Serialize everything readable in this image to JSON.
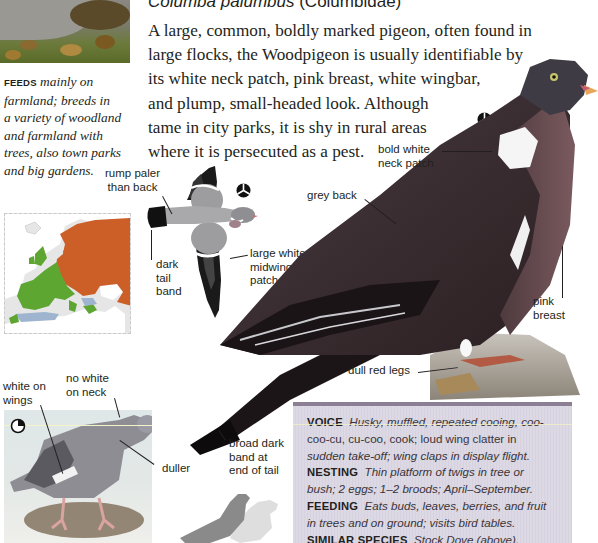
{
  "header": {
    "latin_name": "Columba palumbus",
    "family": "(Columbidae)"
  },
  "intro": {
    "lines": [
      "A large, common, boldly marked pigeon, often found in",
      "large flocks, the Woodpigeon is usually identifiable by",
      "its white neck patch, pink breast, white wingbar,",
      "and plump, small-headed look. Although",
      "tame in city parks, it is shy in rural areas",
      "where it is persecuted as a pest."
    ]
  },
  "feeds": {
    "keyword": "FEEDS",
    "lines": [
      "mainly on",
      "farmland; breeds in",
      "a variety of woodland",
      "and farmland with",
      "trees, also town parks",
      "and big gardens."
    ]
  },
  "flight_labels": {
    "rump": [
      "rump paler",
      "than back"
    ],
    "tail_band": [
      "dark",
      "tail",
      "band"
    ],
    "midwing": [
      "large white",
      "midwing",
      "patch"
    ]
  },
  "adult_labels": {
    "neck_patch": [
      "bold white",
      "neck patch"
    ],
    "grey_back": "grey back",
    "pink_breast": [
      "pink",
      "breast"
    ],
    "legs": "dull red legs",
    "tail_end": [
      "broad dark",
      "band at",
      "end of tail"
    ]
  },
  "juvenile_labels": {
    "white_wings": [
      "white on",
      "wings"
    ],
    "no_white_neck": [
      "no white",
      "on neck"
    ],
    "duller": "duller"
  },
  "symbols": {
    "adult_symbol": "adult-symbol-icon",
    "flight_symbol": "adult-symbol-icon",
    "juvenile_symbol": "juvenile-symbol-icon"
  },
  "info_box": {
    "voice": {
      "keyword": "VOICE",
      "lines": [
        "Husky, muffled, repeated cooing, coo-",
        "coo-cu, cu-coo, cook; loud wing clatter in",
        "sudden take-off; wing claps in display flight."
      ]
    },
    "nesting": {
      "keyword": "NESTING",
      "lines": [
        "Thin platform of twigs in tree or",
        "bush; 2 eggs; 1–2 broods; April–September."
      ]
    },
    "feeding": {
      "keyword": "FEEDING",
      "lines": [
        "Eats buds, leaves, berries, and fruit",
        "in trees and on ground; visits bird tables."
      ]
    },
    "similar": {
      "keyword": "SIMILAR SPECIES",
      "text": "Stock Dove (above)."
    }
  },
  "colors": {
    "text": "#231f20",
    "info_box_bg": "#dcd8e4",
    "info_box_border": "#8c7f93",
    "map_breeding": "#cc5f28",
    "map_resident": "#5ea632",
    "map_winter": "#9fb5cf",
    "map_sea": "#ffffff",
    "map_land": "#e6e6e6"
  }
}
